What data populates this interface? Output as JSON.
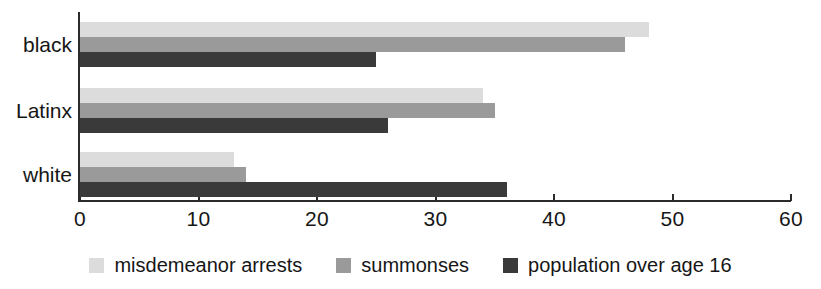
{
  "chart_data": {
    "type": "bar",
    "orientation": "horizontal",
    "title": "",
    "subtitle": "",
    "xlabel": "",
    "ylabel": "",
    "categories": [
      "black",
      "Latinx",
      "white"
    ],
    "series": [
      {
        "name": "misdemeanor arrests",
        "color": "#dcdcdc",
        "values": [
          48,
          34,
          13
        ]
      },
      {
        "name": "summonses",
        "color": "#9a9a9a",
        "values": [
          46,
          35,
          14
        ]
      },
      {
        "name": "population over age 16",
        "color": "#3a3a3a",
        "values": [
          25,
          26,
          36
        ]
      }
    ],
    "xlim": [
      0,
      60
    ],
    "xticks": [
      0,
      10,
      20,
      30,
      40,
      50,
      60
    ],
    "xtick_labels": [
      "0",
      "10",
      "20",
      "30",
      "40",
      "50",
      "60"
    ],
    "grid": false,
    "legend_position": "bottom"
  },
  "axis": {
    "tick_labels": [
      "0",
      "10",
      "20",
      "30",
      "40",
      "50",
      "60"
    ]
  },
  "categories": {
    "labels": [
      "black",
      "Latinx",
      "white"
    ]
  },
  "legend": {
    "items": [
      {
        "label": "misdemeanor arrests",
        "swatch": "light-gray-swatch"
      },
      {
        "label": "summonses",
        "swatch": "medium-gray-swatch"
      },
      {
        "label": "population over age 16",
        "swatch": "dark-gray-swatch"
      }
    ]
  }
}
